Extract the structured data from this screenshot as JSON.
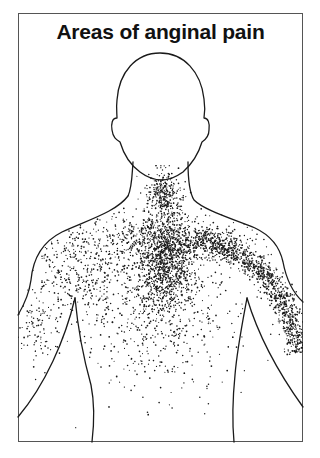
{
  "title": "Areas of anginal pain",
  "figure": {
    "outline_color": "#1a1a1a",
    "stipple_color": "#1a1a1a",
    "pain_regions": [
      {
        "name": "neck-jaw",
        "cx": 163,
        "cy": 195,
        "rx": 14,
        "ry": 22,
        "count": 260
      },
      {
        "name": "central-chest-core",
        "cx": 165,
        "cy": 258,
        "rx": 26,
        "ry": 45,
        "count": 900
      },
      {
        "name": "central-chest-spread",
        "cx": 160,
        "cy": 270,
        "rx": 60,
        "ry": 70,
        "count": 700
      },
      {
        "name": "upper-chest-cross",
        "cx": 168,
        "cy": 240,
        "rx": 75,
        "ry": 18,
        "count": 380
      },
      {
        "name": "lower-chest-fade",
        "cx": 160,
        "cy": 340,
        "rx": 65,
        "ry": 50,
        "count": 230
      },
      {
        "name": "left-shoulder-arm",
        "cx": 75,
        "cy": 270,
        "rx": 45,
        "ry": 50,
        "count": 380
      },
      {
        "name": "left-arm-lower",
        "cx": 38,
        "cy": 330,
        "rx": 18,
        "ry": 35,
        "count": 90
      }
    ],
    "arm_band": {
      "name": "right-arm-band",
      "points": [
        [
          195,
          238
        ],
        [
          225,
          248
        ],
        [
          252,
          262
        ],
        [
          270,
          280
        ],
        [
          283,
          302
        ],
        [
          293,
          325
        ],
        [
          302,
          352
        ]
      ],
      "width": 14,
      "count": 1100
    }
  }
}
